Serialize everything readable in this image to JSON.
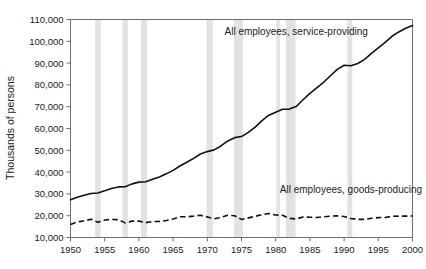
{
  "chart_data": {
    "type": "line",
    "title": "",
    "xlabel": "",
    "ylabel": "Thousands of persons",
    "xlim": [
      1950,
      2000
    ],
    "ylim": [
      10000,
      110000
    ],
    "grid": false,
    "legend_position": "inline-annotations",
    "xticks": [
      1950,
      1955,
      1960,
      1965,
      1970,
      1975,
      1980,
      1985,
      1990,
      1995,
      2000
    ],
    "xtick_labels": [
      "1950",
      "1955",
      "1960",
      "1965",
      "1970",
      "1975",
      "1980",
      "1985",
      "1990",
      "1995",
      "2000"
    ],
    "yticks": [
      10000,
      20000,
      30000,
      40000,
      50000,
      60000,
      70000,
      80000,
      90000,
      100000,
      110000
    ],
    "ytick_labels": [
      "10,000",
      "20,000",
      "30,000",
      "40,000",
      "50,000",
      "60,000",
      "70,000",
      "80,000",
      "90,000",
      "100,000",
      "110,000"
    ],
    "annotations": [
      {
        "text": "All employees, service-providing",
        "x": 1983,
        "y": 103000
      },
      {
        "text": "All employees, goods-producing",
        "x": 1991,
        "y": 30500
      }
    ],
    "recession_bands": [
      {
        "start": 1953.6,
        "end": 1954.4
      },
      {
        "start": 1957.6,
        "end": 1958.4
      },
      {
        "start": 1960.3,
        "end": 1961.2
      },
      {
        "start": 1969.9,
        "end": 1970.8
      },
      {
        "start": 1973.9,
        "end": 1975.2
      },
      {
        "start": 1980.1,
        "end": 1980.6
      },
      {
        "start": 1981.5,
        "end": 1982.9
      },
      {
        "start": 1990.5,
        "end": 1991.2
      }
    ],
    "x": [
      1950,
      1951,
      1952,
      1953,
      1954,
      1955,
      1956,
      1957,
      1958,
      1959,
      1960,
      1961,
      1962,
      1963,
      1964,
      1965,
      1966,
      1967,
      1968,
      1969,
      1970,
      1971,
      1972,
      1973,
      1974,
      1975,
      1976,
      1977,
      1978,
      1979,
      1980,
      1981,
      1982,
      1983,
      1984,
      1985,
      1986,
      1987,
      1988,
      1989,
      1990,
      1991,
      1992,
      1993,
      1994,
      1995,
      1996,
      1997,
      1998,
      1999,
      2000
    ],
    "series": [
      {
        "name": "All employees, service-providing",
        "style": "solid",
        "color": "#111111",
        "values": [
          27300,
          28500,
          29400,
          30200,
          30400,
          31400,
          32500,
          33200,
          33300,
          34600,
          35400,
          35600,
          36700,
          37800,
          39200,
          40800,
          42800,
          44500,
          46300,
          48300,
          49400,
          50200,
          52000,
          54300,
          55800,
          56300,
          58200,
          60600,
          63600,
          66100,
          67500,
          68800,
          68900,
          70100,
          73200,
          76100,
          78600,
          81200,
          84200,
          87100,
          89000,
          88800,
          89800,
          91700,
          94500,
          97000,
          99500,
          102300,
          104300,
          106000,
          107300
        ]
      },
      {
        "name": "All employees, goods-producing",
        "style": "dashed",
        "color": "#111111",
        "values": [
          16000,
          17200,
          17600,
          18400,
          17000,
          18000,
          18300,
          18200,
          16700,
          17500,
          17500,
          16800,
          17300,
          17400,
          17800,
          18500,
          19500,
          19500,
          19800,
          20200,
          19400,
          18600,
          19200,
          20200,
          20000,
          18300,
          19000,
          19700,
          20500,
          21000,
          20300,
          20200,
          18800,
          18500,
          19400,
          19300,
          19200,
          19500,
          19800,
          19900,
          19600,
          18700,
          18300,
          18300,
          18800,
          19100,
          19200,
          19700,
          19800,
          19800,
          19900
        ]
      }
    ]
  }
}
